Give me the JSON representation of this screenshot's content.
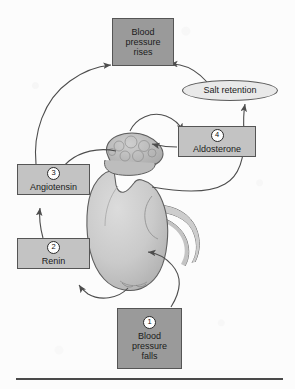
{
  "figure": {
    "background_color": "#fcfcfc",
    "rule_color": "#4a4a4a"
  },
  "colors": {
    "box_dark": "#9a9a9a",
    "box_light": "#c3c3c3",
    "ellipse": "#e9e9e9",
    "outline": "#555555",
    "arrow": "#4d4d4d",
    "kidney_fill": "#c9c9c9",
    "adrenal_fill": "#b6b6b6"
  },
  "nodes": {
    "bp_rises": {
      "id": "blood-pressure-rises",
      "shape": "box",
      "line1": "Blood",
      "line2": "pressure",
      "line3": "rises"
    },
    "salt_retention": {
      "id": "salt-retention",
      "shape": "ellipse",
      "label": "Salt retention"
    },
    "aldosterone": {
      "id": "aldosterone",
      "shape": "box",
      "number": "4",
      "label": "Aldosterone"
    },
    "angiotensin": {
      "id": "angiotensin",
      "shape": "box",
      "number": "3",
      "label": "Angiotensin"
    },
    "renin": {
      "id": "renin",
      "shape": "box",
      "number": "2",
      "label": "Renin"
    },
    "bp_falls": {
      "id": "blood-pressure-falls",
      "shape": "box",
      "number": "1",
      "line1": "Blood",
      "line2": "pressure",
      "line3": "falls"
    }
  },
  "anatomy": {
    "kidney": "kidney",
    "adrenal_gland": "adrenal-gland",
    "ureter": "ureter"
  },
  "flow": [
    {
      "from": "blood-pressure-falls",
      "to": "kidney"
    },
    {
      "from": "kidney",
      "to": "renin"
    },
    {
      "from": "renin",
      "to": "angiotensin"
    },
    {
      "from": "angiotensin",
      "to": "blood-pressure-rises"
    },
    {
      "from": "kidney",
      "to": "angiotensin"
    },
    {
      "from": "adrenal-gland",
      "to": "aldosterone"
    },
    {
      "from": "aldosterone",
      "to": "kidney"
    },
    {
      "from": "kidney",
      "to": "salt-retention"
    },
    {
      "from": "salt-retention",
      "to": "blood-pressure-rises"
    }
  ]
}
